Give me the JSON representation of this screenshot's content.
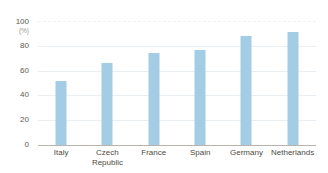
{
  "chart_data": {
    "type": "bar",
    "title": "",
    "xlabel": "",
    "ylabel": "(%)",
    "categories": [
      "Italy",
      "Czech Republic",
      "France",
      "Spain",
      "Germany",
      "Netherlands"
    ],
    "values": [
      52,
      66,
      74,
      77,
      88,
      91
    ],
    "ylim": [
      0,
      100
    ],
    "yticks": [
      0,
      20,
      40,
      60,
      80,
      100
    ],
    "ytick_labels": [
      "0",
      "20",
      "40",
      "60",
      "80",
      "100"
    ],
    "grid": true,
    "legend": "none",
    "bar_color": "#a3cde4",
    "gridline_color": "#e9eef2",
    "axis_color": "#b9b4ab",
    "tick_label_color": "#5d5a54",
    "unit_label_color": "#9c9890"
  },
  "axis": {
    "unit": "(%)",
    "ticks": {
      "t0": "0",
      "t20": "20",
      "t40": "40",
      "t60": "60",
      "t80": "80",
      "t100": "100"
    }
  },
  "categories": {
    "c0": "Italy",
    "c1": "Czech\nRepublic",
    "c2": "France",
    "c3": "Spain",
    "c4": "Germany",
    "c5": "Netherlands"
  }
}
